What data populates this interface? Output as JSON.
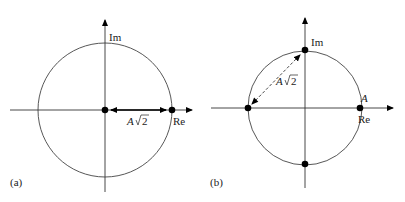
{
  "panels": [
    {
      "id": "a",
      "label": "(a)",
      "axis_labels": {
        "imag": "Im",
        "real": "Re"
      },
      "distance_label": {
        "main": "A",
        "radical": "2"
      },
      "points": [
        {
          "name": "origin",
          "re": 0,
          "im": 0
        },
        {
          "name": "on-real-axis",
          "re": 1,
          "im": 0
        }
      ],
      "arrow": {
        "style": "solid",
        "from": "origin",
        "to": "on-real-axis",
        "double_headed": true
      }
    },
    {
      "id": "b",
      "label": "(b)",
      "axis_labels": {
        "imag": "Im",
        "real": "Re"
      },
      "point_label": "A",
      "distance_label": {
        "main": "A",
        "radical": "2"
      },
      "points": [
        {
          "name": "top",
          "re": 0,
          "im": 1
        },
        {
          "name": "left",
          "re": -1,
          "im": 0
        },
        {
          "name": "right",
          "re": 1,
          "im": 0
        },
        {
          "name": "bottom",
          "re": 0,
          "im": -1
        }
      ],
      "arrow": {
        "style": "dashed",
        "from": "left",
        "to": "top",
        "double_headed": true
      }
    }
  ]
}
